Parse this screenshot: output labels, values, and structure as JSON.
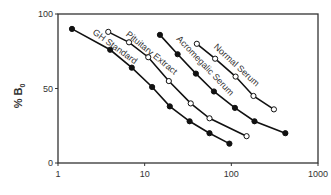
{
  "chart_data": {
    "type": "line",
    "title": "",
    "xlabel": "",
    "ylabel": "% B0",
    "xscale": "log",
    "xlim": [
      1,
      1000
    ],
    "ylim": [
      0,
      100
    ],
    "x_ticks": [
      "1",
      "10",
      "100",
      "1000"
    ],
    "y_ticks": [
      "0",
      "50",
      "100"
    ],
    "grid": false,
    "legend": "inline labels along curves",
    "series": [
      {
        "name": "GH Standard",
        "marker": "filled",
        "x": [
          1.45,
          4.0,
          7.1,
          12.2,
          19.5,
          33,
          56,
          95
        ],
        "y": [
          90,
          76,
          64,
          51,
          38,
          28,
          20,
          13
        ]
      },
      {
        "name": "Pituitary Extract",
        "marker": "open",
        "x": [
          3.8,
          6.6,
          11,
          19,
          34,
          56,
          150
        ],
        "y": [
          88,
          81,
          71,
          55,
          40,
          30,
          18
        ]
      },
      {
        "name": "Acromegalic Serum",
        "marker": "filled",
        "x": [
          15,
          24,
          39,
          63,
          110,
          185,
          420
        ],
        "y": [
          86,
          73,
          60,
          48,
          37,
          28,
          20
        ]
      },
      {
        "name": "Normal Serum",
        "marker": "open",
        "x": [
          40,
          65,
          112,
          180,
          310
        ],
        "y": [
          80,
          70,
          58,
          45,
          36
        ]
      }
    ]
  },
  "axes": {
    "ylabel_main": "% B",
    "ylabel_sub": "0"
  }
}
